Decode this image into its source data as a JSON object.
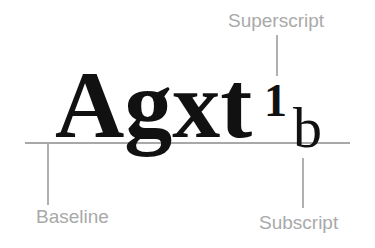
{
  "diagram": {
    "main_text": "Agxt",
    "superscript_text": "1",
    "subscript_text": "b",
    "labels": {
      "superscript": "Superscript",
      "baseline": "Baseline",
      "subscript": "Subscript"
    },
    "colors": {
      "glyph": "#111111",
      "label": "#a9a9a9",
      "line": "#b0b0b0"
    }
  }
}
